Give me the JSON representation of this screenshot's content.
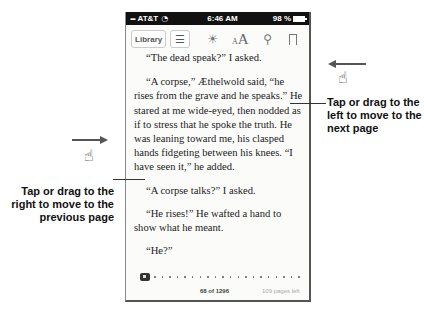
{
  "status_bar": {
    "carrier": "AT&T",
    "time": "6:46 AM",
    "battery": "98 %"
  },
  "toolbar": {
    "library_label": "Library",
    "toc_icon": "list-icon",
    "brightness_icon": "sun-icon",
    "font_small": "A",
    "font_big": "A",
    "search_icon": "search-icon",
    "bookmark_icon": "bookmark-icon"
  },
  "page": {
    "paragraphs": [
      "“The dead speak?” I asked.",
      "“A corpse,” Æthelwold said, “he rises from the grave and he speaks.” He stared at me wide-eyed, then nodded as if to stress that he spoke the truth. He was leaning toward me, his clasped hands fidgeting between his knees. “I have seen it,” he added.",
      "“A corpse talks?” I asked.",
      "“He rises!” He wafted a hand to show what he meant.",
      "“He?”"
    ]
  },
  "footer": {
    "page_number": "68 of 1296",
    "pages_left": "109 pages left"
  },
  "callouts": {
    "next_page": "Tap or drag to the left to move to the next page",
    "previous_page": "Tap or drag to the right to move to the previous page"
  },
  "colors": {
    "status_bar_bg": "#111111",
    "page_bg": "#fbfbfa",
    "text": "#222222"
  }
}
